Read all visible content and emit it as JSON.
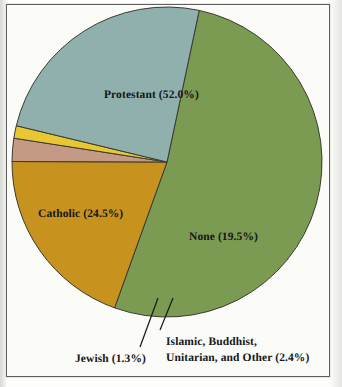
{
  "figure": {
    "background_color": "#fbfbf8",
    "frame_color": "#5d5f5c",
    "label_color": "#16161a"
  },
  "chart_data": {
    "type": "pie",
    "title": "",
    "subtitle": "",
    "xlabel": "",
    "ylabel": "",
    "legend_position": "none",
    "grid": false,
    "units": "percent",
    "total": 99.7,
    "start_angle_deg": 12,
    "direction": "clockwise",
    "categories": [
      "Protestant",
      "None",
      "Islamic, Buddhist, Unitarian, and Other",
      "Jewish",
      "Catholic"
    ],
    "values": [
      52.0,
      19.5,
      2.4,
      1.3,
      24.5
    ],
    "colors": [
      "#7c9b52",
      "#c8921f",
      "#c49a84",
      "#e8c832",
      "#8fb0ad"
    ],
    "slices": [
      {
        "name": "Protestant",
        "value": 52.0,
        "label": "Protestant (52.0%)",
        "color": "#7c9b52",
        "label_placement": "inside",
        "leader_line": false
      },
      {
        "name": "None",
        "value": 19.5,
        "label": "None (19.5%)",
        "color": "#c8921f",
        "label_placement": "inside",
        "leader_line": false
      },
      {
        "name": "Islamic, Buddhist, Unitarian, and Other",
        "value": 2.4,
        "label_line_1": "Islamic, Buddhist,",
        "label_line_2": "Unitarian, and Other (2.4%)",
        "color": "#c49a84",
        "label_placement": "outside-below",
        "leader_line": true
      },
      {
        "name": "Jewish",
        "value": 1.3,
        "label": "Jewish (1.3%)",
        "color": "#e8c832",
        "label_placement": "outside-below",
        "leader_line": true
      },
      {
        "name": "Catholic",
        "value": 24.5,
        "label": "Catholic (24.5%)",
        "color": "#8fb0ad",
        "label_placement": "inside",
        "leader_line": false
      }
    ]
  }
}
